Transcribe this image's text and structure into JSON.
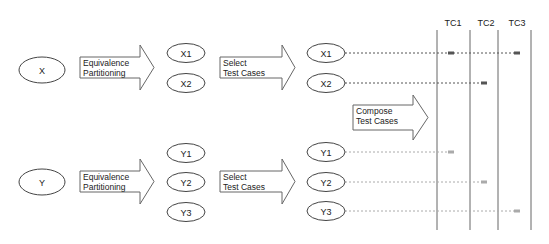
{
  "diagram": {
    "inputs": [
      {
        "id": "x",
        "label": "X",
        "cx": 42,
        "cy": 70
      },
      {
        "id": "y",
        "label": "Y",
        "cx": 42,
        "cy": 182
      }
    ],
    "arrows": [
      {
        "id": "ep-x",
        "lines": [
          "Equivalence",
          "Partitioning"
        ],
        "x": 80,
        "y": 57,
        "w": 60,
        "h": 21,
        "tip": 154,
        "top": 45,
        "bottom": 90
      },
      {
        "id": "sel-x",
        "lines": [
          "Select",
          "Test Cases"
        ],
        "x": 220,
        "y": 57,
        "w": 62,
        "h": 21,
        "tip": 295,
        "top": 45,
        "bottom": 90
      },
      {
        "id": "ep-y",
        "lines": [
          "Equivalence",
          "Partitioning"
        ],
        "x": 80,
        "y": 171,
        "w": 60,
        "h": 21,
        "tip": 154,
        "top": 159,
        "bottom": 204
      },
      {
        "id": "sel-y",
        "lines": [
          "Select",
          "Test Cases"
        ],
        "x": 220,
        "y": 171,
        "w": 62,
        "h": 21,
        "tip": 295,
        "top": 159,
        "bottom": 204
      },
      {
        "id": "compose",
        "lines": [
          "Compose",
          "Test Cases"
        ],
        "x": 353,
        "y": 105,
        "w": 60,
        "h": 25,
        "tip": 428,
        "top": 95,
        "bottom": 140
      }
    ],
    "partitions": [
      {
        "label": "X1",
        "cx": 186,
        "cy": 53
      },
      {
        "label": "X2",
        "cx": 186,
        "cy": 83
      },
      {
        "label": "Y1",
        "cx": 186,
        "cy": 153
      },
      {
        "label": "Y2",
        "cx": 186,
        "cy": 182
      },
      {
        "label": "Y3",
        "cx": 186,
        "cy": 212
      }
    ],
    "selected": [
      {
        "label": "X1",
        "cx": 326,
        "cy": 53,
        "dots": [
          451,
          517
        ],
        "end": 517,
        "color": "#555555"
      },
      {
        "label": "X2",
        "cx": 326,
        "cy": 83,
        "dots": [
          484
        ],
        "end": 484,
        "color": "#555555"
      },
      {
        "label": "Y1",
        "cx": 326,
        "cy": 152,
        "dots": [
          451
        ],
        "end": 451,
        "color": "#aaaaaa"
      },
      {
        "label": "Y2",
        "cx": 326,
        "cy": 182,
        "dots": [
          484
        ],
        "end": 484,
        "color": "#aaaaaa"
      },
      {
        "label": "Y3",
        "cx": 326,
        "cy": 211,
        "dots": [
          517
        ],
        "end": 517,
        "color": "#aaaaaa"
      }
    ],
    "test_cases": [
      {
        "label": "TC1",
        "x": 445
      },
      {
        "label": "TC2",
        "x": 478
      },
      {
        "label": "TC3",
        "x": 509
      }
    ],
    "columns": [
      437,
      470,
      498,
      531
    ],
    "column_top": 30,
    "column_bottom": 230,
    "colors": {
      "stroke": "#444444",
      "text": "#222222"
    }
  }
}
